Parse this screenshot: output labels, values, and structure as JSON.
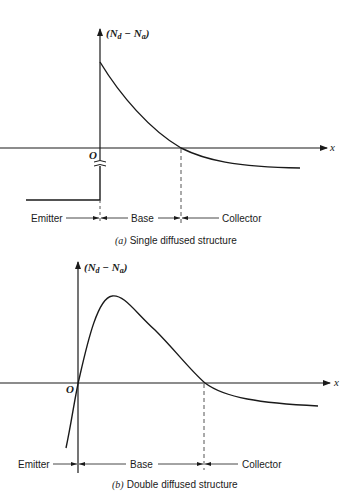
{
  "diagrams": [
    {
      "id": "a",
      "caption_letter": "(a)",
      "caption_text": "Single diffused structure",
      "y_axis_label": "(N",
      "y_axis_sub_d": "d",
      "y_axis_minus": " − N",
      "y_axis_sub_a": "a",
      "y_axis_close": ")",
      "x_axis_label": "x",
      "origin_label": "O",
      "regions": [
        "Emitter",
        "Base",
        "Collector"
      ]
    },
    {
      "id": "b",
      "caption_letter": "(b)",
      "caption_text": "Double diffused structure",
      "y_axis_label": "(N",
      "y_axis_sub_d": "d",
      "y_axis_minus": " − N",
      "y_axis_sub_a": "a",
      "y_axis_close": ")",
      "x_axis_label": "x",
      "origin_label": "O",
      "regions": [
        "Emitter",
        "Base",
        "Collector"
      ]
    }
  ],
  "colors": {
    "ink": "#1a1a1a",
    "background": "#ffffff",
    "dashed": "#555555"
  }
}
